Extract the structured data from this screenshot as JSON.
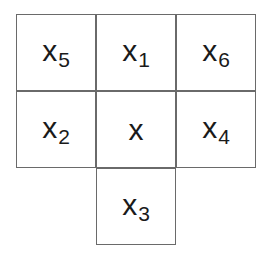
{
  "diagram": {
    "cells": [
      {
        "id": "x5",
        "base": "x",
        "sub": "5",
        "row": 0,
        "col": 0
      },
      {
        "id": "x1",
        "base": "x",
        "sub": "1",
        "row": 0,
        "col": 1
      },
      {
        "id": "x6",
        "base": "x",
        "sub": "6",
        "row": 0,
        "col": 2
      },
      {
        "id": "x2",
        "base": "x",
        "sub": "2",
        "row": 1,
        "col": 0
      },
      {
        "id": "x",
        "base": "x",
        "sub": "",
        "row": 1,
        "col": 1
      },
      {
        "id": "x4",
        "base": "x",
        "sub": "4",
        "row": 1,
        "col": 2
      },
      {
        "id": "x3",
        "base": "x",
        "sub": "3",
        "row": 2,
        "col": 1
      }
    ],
    "border_color": "#6a6a6a",
    "text_color": "#1a1a1a"
  }
}
